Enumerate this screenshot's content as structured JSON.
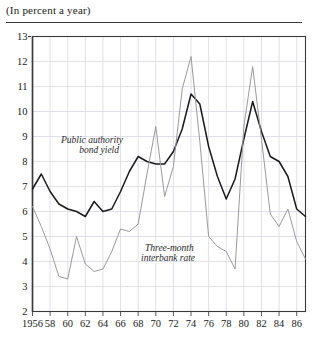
{
  "caption": "(In percent a year)",
  "colors": {
    "bond_yield": "#1a1a1a",
    "interbank": "#9a9a9a",
    "grid": "#d8d8e4",
    "axis": "#3a3a3a"
  },
  "annotations": {
    "bond_line1": "Public authority",
    "bond_line2": "bond yield",
    "interbank_line1": "Three-month",
    "interbank_line2": "interbank rate"
  },
  "chart_data": {
    "type": "line",
    "title": "(In percent a year)",
    "xlabel": "",
    "ylabel": "",
    "xlim": [
      1956,
      1987
    ],
    "ylim": [
      2,
      13
    ],
    "grid": true,
    "legend": "inline-annotations",
    "yticks": [
      2,
      3,
      4,
      5,
      6,
      7,
      8,
      9,
      10,
      11,
      12,
      13
    ],
    "ytick_labels": [
      "2",
      "3",
      "4",
      "5",
      "6",
      "7",
      "8",
      "9",
      "10",
      "11",
      "12",
      "13"
    ],
    "xticks": [
      1956,
      1958,
      1960,
      1962,
      1964,
      1966,
      1968,
      1970,
      1972,
      1974,
      1976,
      1978,
      1980,
      1982,
      1984,
      1986
    ],
    "xtick_labels": [
      "1956",
      "58",
      "60",
      "62",
      "64",
      "66",
      "68",
      "70",
      "72",
      "74",
      "76",
      "78",
      "80",
      "82",
      "84",
      "86"
    ],
    "x": [
      1956,
      1957,
      1958,
      1959,
      1960,
      1961,
      1962,
      1963,
      1964,
      1965,
      1966,
      1967,
      1968,
      1969,
      1970,
      1971,
      1972,
      1973,
      1974,
      1975,
      1976,
      1977,
      1978,
      1979,
      1980,
      1981,
      1982,
      1983,
      1984,
      1985,
      1986,
      1987
    ],
    "series": [
      {
        "name": "Public authority bond yield",
        "color": "#1a1a1a",
        "values": [
          6.9,
          7.5,
          6.8,
          6.3,
          6.1,
          6.0,
          5.8,
          6.4,
          6.0,
          6.1,
          6.8,
          7.6,
          8.2,
          8.0,
          7.9,
          7.9,
          8.4,
          9.3,
          10.7,
          10.3,
          8.6,
          7.4,
          6.5,
          7.3,
          8.9,
          10.4,
          9.2,
          8.2,
          8.0,
          7.4,
          6.1,
          5.8
        ]
      },
      {
        "name": "Three-month interbank rate",
        "color": "#9a9a9a",
        "values": [
          6.2,
          5.4,
          4.5,
          3.4,
          3.3,
          5.0,
          3.9,
          3.6,
          3.7,
          4.4,
          5.3,
          5.2,
          5.5,
          7.5,
          9.4,
          6.6,
          7.8,
          10.9,
          12.2,
          8.8,
          5.0,
          4.6,
          4.4,
          3.7,
          9.4,
          11.8,
          8.9,
          5.9,
          5.4,
          6.1,
          4.8,
          4.1
        ]
      }
    ]
  }
}
